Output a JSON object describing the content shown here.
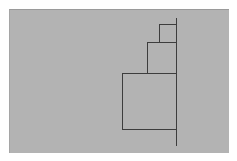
{
  "diagram": {
    "colors": {
      "page_background": "#ffffff",
      "panel_background": "#b3b3b3",
      "stroke": "#3d3d3d"
    },
    "axis_line": {
      "x": 176,
      "y_top": 18,
      "y_bottom": 146
    },
    "squares": [
      {
        "name": "small",
        "left": 159,
        "top": 24,
        "right": 176,
        "bottom": 42
      },
      {
        "name": "medium",
        "left": 147,
        "top": 42,
        "right": 176,
        "bottom": 73
      },
      {
        "name": "large",
        "left": 122,
        "top": 73,
        "right": 176,
        "bottom": 129
      }
    ]
  }
}
